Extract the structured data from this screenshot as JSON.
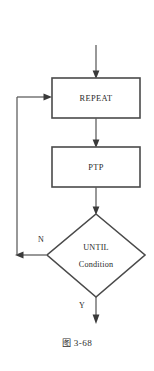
{
  "figure": {
    "caption": "图  3-68",
    "caption_prefix": "图",
    "caption_number": "3-68",
    "background_color": "#ffffff",
    "line_color": "#5a5a5a",
    "shape_border_color": "#4a4a4a",
    "text_color": "#2a2a2a"
  },
  "diagram": {
    "type": "flowchart",
    "nodes": [
      {
        "id": "entry",
        "shape": "arrow",
        "label": "",
        "x": 96,
        "y": 45
      },
      {
        "id": "repeat",
        "shape": "rectangle",
        "label": "REPEAT",
        "x": 96,
        "y": 98,
        "width": 88,
        "height": 40
      },
      {
        "id": "ptp",
        "shape": "rectangle",
        "label": "PTP",
        "x": 96,
        "y": 167,
        "width": 88,
        "height": 40
      },
      {
        "id": "until",
        "shape": "diamond",
        "label_line1": "UNTIL",
        "label_line2": "Condition",
        "x": 96,
        "y": 255,
        "width": 98,
        "height": 84
      }
    ],
    "edges": [
      {
        "id": "entry-to-repeat",
        "from": "entry",
        "to": "repeat",
        "label": ""
      },
      {
        "id": "repeat-to-ptp",
        "from": "repeat",
        "to": "ptp",
        "label": ""
      },
      {
        "id": "ptp-to-until",
        "from": "ptp",
        "to": "until",
        "label": ""
      },
      {
        "id": "until-no-loopback",
        "from": "until",
        "to": "repeat",
        "label": "N"
      },
      {
        "id": "until-yes-exit",
        "from": "until",
        "to": "exit",
        "label": "Y"
      }
    ],
    "branch_labels": {
      "no": "N",
      "yes": "Y"
    }
  }
}
